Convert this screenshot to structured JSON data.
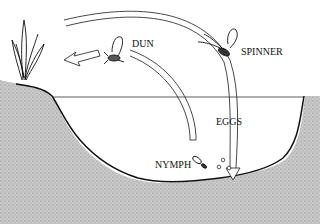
{
  "diagram": {
    "type": "mayfly-life-cycle",
    "stages": [
      {
        "id": "dun",
        "label": "DUN"
      },
      {
        "id": "spinner",
        "label": "SPINNER"
      },
      {
        "id": "eggs",
        "label": "EGGS"
      },
      {
        "id": "nymph",
        "label": "NYMPH"
      }
    ],
    "colors": {
      "ink": "#111111",
      "water": "#ffffff",
      "ground": "#bdbdbd"
    }
  }
}
